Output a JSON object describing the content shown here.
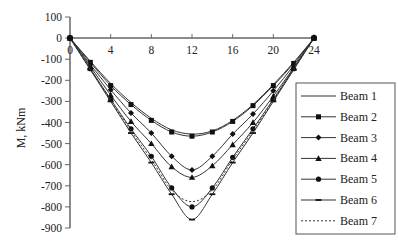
{
  "chart_data": {
    "type": "line",
    "title": "",
    "xlabel": "",
    "ylabel": "M, kNm",
    "xlim": [
      0,
      24
    ],
    "ylim": [
      -900,
      100
    ],
    "x_ticks": [
      0,
      4,
      8,
      12,
      16,
      20,
      24
    ],
    "y_ticks": [
      100,
      0,
      -100,
      -200,
      -300,
      -400,
      -500,
      -600,
      -700,
      -800,
      -900
    ],
    "grid": false,
    "legend_position": "right",
    "x": [
      0,
      2,
      4,
      6,
      8,
      10,
      12,
      14,
      16,
      18,
      20,
      22,
      24
    ],
    "series": [
      {
        "name": "Beam 1",
        "marker": "none",
        "dash": "solid",
        "values": [
          0,
          -110,
          -215,
          -305,
          -380,
          -435,
          -455,
          -440,
          -390,
          -315,
          -220,
          -115,
          0
        ]
      },
      {
        "name": "Beam 2",
        "marker": "square",
        "dash": "solid",
        "values": [
          0,
          -115,
          -225,
          -315,
          -390,
          -445,
          -465,
          -445,
          -395,
          -320,
          -225,
          -120,
          0
        ]
      },
      {
        "name": "Beam 3",
        "marker": "diamond",
        "dash": "solid",
        "values": [
          0,
          -125,
          -245,
          -355,
          -450,
          -560,
          -625,
          -560,
          -455,
          -360,
          -250,
          -130,
          0
        ]
      },
      {
        "name": "Beam 4",
        "marker": "triangle",
        "dash": "solid",
        "values": [
          0,
          -135,
          -270,
          -395,
          -500,
          -610,
          -660,
          -605,
          -505,
          -400,
          -275,
          -140,
          0
        ]
      },
      {
        "name": "Beam 5",
        "marker": "circle",
        "dash": "solid",
        "values": [
          0,
          -145,
          -290,
          -430,
          -560,
          -710,
          -800,
          -710,
          -565,
          -430,
          -290,
          -145,
          0
        ]
      },
      {
        "name": "Beam 6",
        "marker": "dash",
        "dash": "solid",
        "values": [
          0,
          -150,
          -300,
          -450,
          -590,
          -740,
          -860,
          -740,
          -590,
          -450,
          -300,
          -150,
          0
        ]
      },
      {
        "name": "Beam 7",
        "marker": "none",
        "dash": "dotted",
        "values": [
          0,
          -148,
          -295,
          -440,
          -575,
          -720,
          -775,
          -720,
          -575,
          -440,
          -295,
          -148,
          0
        ]
      }
    ]
  },
  "legend": {
    "items": [
      "Beam 1",
      "Beam 2",
      "Beam 3",
      "Beam 4",
      "Beam 5",
      "Beam 6",
      "Beam 7"
    ]
  },
  "axes": {
    "ylabel": "M, kNm",
    "x_tick_labels": [
      "0",
      "4",
      "8",
      "12",
      "16",
      "20",
      "24"
    ],
    "y_tick_labels": [
      "100",
      "0",
      "-100",
      "-200",
      "-300",
      "-400",
      "-500",
      "-600",
      "-700",
      "-800",
      "-900"
    ]
  }
}
